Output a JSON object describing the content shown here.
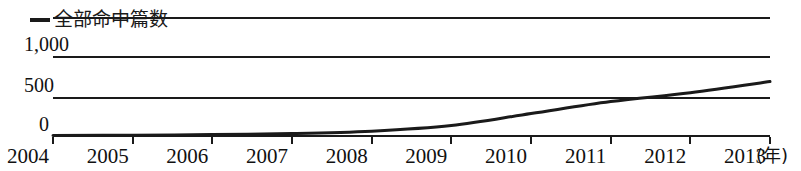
{
  "legend": {
    "marker_icon": "line-marker-icon",
    "label": "全部命中篇数",
    "position": "top-left"
  },
  "axes": {
    "y_ticks": [
      "0",
      "500",
      "1,000"
    ],
    "x_ticks": [
      "2004",
      "2005",
      "2006",
      "2007",
      "2008",
      "2009",
      "2010",
      "2011",
      "2012",
      "2013"
    ],
    "x_unit": "(年)"
  },
  "colors": {
    "series": "#1a1a1a",
    "grid": "#1a1a1a",
    "text": "#111111",
    "background": "#ffffff"
  },
  "chart_data": {
    "type": "line",
    "title": "",
    "xlabel": "(年)",
    "ylabel": "",
    "grid": true,
    "legend_position": "top-left",
    "xlim": [
      2004,
      2013
    ],
    "ylim": [
      0,
      1000
    ],
    "yticks": [
      0,
      500,
      1000
    ],
    "ytick_labels": [
      "0",
      "500",
      "1,000"
    ],
    "categories": [
      "2004",
      "2005",
      "2006",
      "2007",
      "2008",
      "2009",
      "2010",
      "2011",
      "2012",
      "2013"
    ],
    "x": [
      2004,
      2005,
      2006,
      2007,
      2008,
      2009,
      2010,
      2011,
      2012,
      2013
    ],
    "series": [
      {
        "name": "全部命中篇数",
        "values": [
          5,
          10,
          18,
          30,
          60,
          130,
          280,
          430,
          540,
          680
        ]
      }
    ]
  }
}
